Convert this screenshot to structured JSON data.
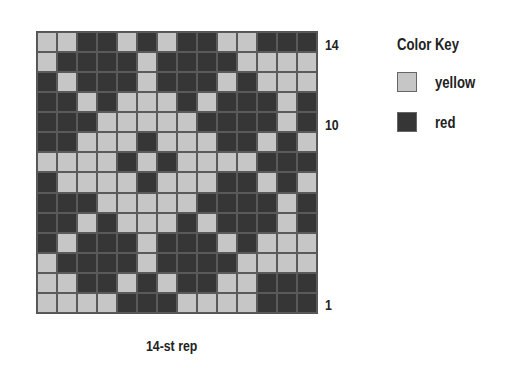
{
  "chart": {
    "title": "Color Key",
    "caption": "14-st rep",
    "row_labels": [
      {
        "text": "14",
        "row": 14
      },
      {
        "text": "10",
        "row": 10
      },
      {
        "text": "1",
        "row": 1
      }
    ],
    "key": [
      {
        "code": "Y",
        "label": "yellow",
        "color": "#c6c6c6"
      },
      {
        "code": "R",
        "label": "red",
        "color": "#363636"
      }
    ],
    "columns": 14,
    "rows_top_to_bottom": [
      "YYRRYRYRRYYRRR",
      "YRRRRYRRRRYYYY",
      "RYRRRYRRRYRYYY",
      "RRYRYYYRYRRRYR",
      "RRRYYYYYRRRRYR",
      "RRYYYRYYYRRYRY",
      "YYYYRYRYYYYRRR",
      "RYYYYRYYYRRYRY",
      "RRRYYYYYRRRRYR",
      "RRYRYYYRYRRRYR",
      "RYRRRYRRRYRYYY",
      "YRRRRYRRRRYYYY",
      "YYRRYRYRRYYRRR",
      "YYYYRRRYYYYRRR"
    ]
  }
}
